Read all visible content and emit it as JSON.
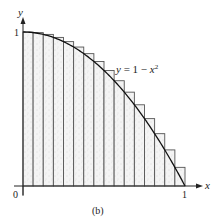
{
  "diagram": {
    "function_label": "y = 1 − x²",
    "function_label_parts": {
      "lhs": "y",
      "eq": " = 1 − ",
      "var": "x",
      "exp": "2"
    },
    "x_axis_label": "x",
    "y_axis_label": "y",
    "x_ticks": [
      {
        "value": 0,
        "label": "0"
      },
      {
        "value": 1,
        "label": "1"
      }
    ],
    "y_ticks": [
      {
        "value": 1,
        "label": "1"
      }
    ],
    "caption": "(b)",
    "subintervals": 16,
    "rectangle_type": "upper sum (left endpoints)",
    "shading_color": "#d9d9d9",
    "rect_stroke_color": "#555555",
    "curve_color": "#111111"
  }
}
